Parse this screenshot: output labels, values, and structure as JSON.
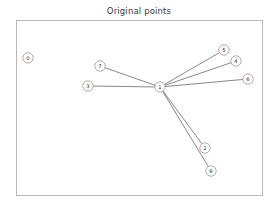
{
  "figure": {
    "title": "Original points",
    "width": 278,
    "height": 212,
    "background_color": "#ffffff",
    "frame": {
      "x": 16,
      "y": 20,
      "width": 247,
      "height": 176,
      "border_color": "#b9b9b9"
    }
  },
  "chart_data": {
    "type": "scatter",
    "title": "Original points",
    "xlabel": "",
    "ylabel": "",
    "grid": false,
    "legend": false,
    "axis_ticks": false,
    "node_radius": 5.2,
    "node_fill": "#ffffff",
    "node_stroke": "#8a8a8a",
    "edge_color": "#555555",
    "nodes": [
      {
        "id": "0",
        "label": "0",
        "x": 28,
        "y": 58
      },
      {
        "id": "1",
        "label": "1",
        "x": 160,
        "y": 87
      },
      {
        "id": "2",
        "label": "2",
        "x": 205,
        "y": 148
      },
      {
        "id": "3",
        "label": "3",
        "x": 88,
        "y": 86
      },
      {
        "id": "4",
        "label": "4",
        "x": 236,
        "y": 61
      },
      {
        "id": "5",
        "label": "5",
        "x": 224,
        "y": 50
      },
      {
        "id": "6",
        "label": "6",
        "x": 248,
        "y": 79
      },
      {
        "id": "7",
        "label": "7",
        "x": 100,
        "y": 66
      },
      {
        "id": "8",
        "label": "8",
        "x": 211,
        "y": 171
      }
    ],
    "edges": [
      {
        "source": "1",
        "target": "7"
      },
      {
        "source": "1",
        "target": "3"
      },
      {
        "source": "1",
        "target": "5"
      },
      {
        "source": "1",
        "target": "4"
      },
      {
        "source": "1",
        "target": "6"
      },
      {
        "source": "1",
        "target": "2"
      },
      {
        "source": "1",
        "target": "8"
      }
    ],
    "isolated_nodes": [
      "0"
    ]
  }
}
